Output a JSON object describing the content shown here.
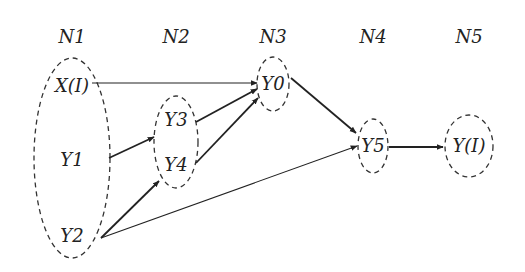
{
  "diagram": {
    "type": "layered-network",
    "layers": [
      {
        "id": "N1",
        "label": "N1",
        "x": 72,
        "ellipse": {
          "cx": 72,
          "cy": 158,
          "rx": 38,
          "ry": 100
        },
        "nodes": [
          {
            "id": "X(I)",
            "label": "X(I)",
            "x": 72,
            "y": 86
          },
          {
            "id": "Y1",
            "label": "Y1",
            "x": 72,
            "y": 160
          },
          {
            "id": "Y2",
            "label": "Y2",
            "x": 72,
            "y": 236
          }
        ]
      },
      {
        "id": "N2",
        "label": "N2",
        "x": 176,
        "ellipse": {
          "cx": 176,
          "cy": 142,
          "rx": 22,
          "ry": 46
        },
        "nodes": [
          {
            "id": "Y3",
            "label": "Y3",
            "x": 176,
            "y": 120
          },
          {
            "id": "Y4",
            "label": "Y4",
            "x": 176,
            "y": 165
          }
        ]
      },
      {
        "id": "N3",
        "label": "N3",
        "x": 273,
        "ellipse": {
          "cx": 273,
          "cy": 84,
          "rx": 16,
          "ry": 27
        },
        "nodes": [
          {
            "id": "Y0",
            "label": "Y0",
            "x": 273,
            "y": 84
          }
        ]
      },
      {
        "id": "N4",
        "label": "N4",
        "x": 373,
        "ellipse": {
          "cx": 373,
          "cy": 146,
          "rx": 15,
          "ry": 27
        },
        "nodes": [
          {
            "id": "Y5",
            "label": "Y5",
            "x": 373,
            "y": 146
          }
        ]
      },
      {
        "id": "N5",
        "label": "N5",
        "x": 469,
        "ellipse": {
          "cx": 469,
          "cy": 146,
          "rx": 24,
          "ry": 31
        },
        "nodes": [
          {
            "id": "Y(I)",
            "label": "Y(I)",
            "x": 469,
            "y": 146
          }
        ]
      }
    ],
    "edges": [
      {
        "from": "X(I)",
        "to": "Y0",
        "x1": 92,
        "y1": 83,
        "x2": 257,
        "y2": 83,
        "width": 1.1
      },
      {
        "from": "Y1",
        "to": "Y3",
        "x1": 109,
        "y1": 158,
        "x2": 154,
        "y2": 137,
        "width": 1.8
      },
      {
        "from": "Y2",
        "to": "Y4",
        "x1": 101,
        "y1": 238,
        "x2": 159,
        "y2": 181,
        "width": 1.8
      },
      {
        "from": "Y2",
        "to": "Y5",
        "x1": 101,
        "y1": 238,
        "x2": 357,
        "y2": 146,
        "width": 1.1
      },
      {
        "from": "Y3",
        "to": "Y0",
        "x1": 196,
        "y1": 122,
        "x2": 257,
        "y2": 89,
        "width": 1.8
      },
      {
        "from": "Y4",
        "to": "Y0",
        "x1": 196,
        "y1": 163,
        "x2": 258,
        "y2": 98,
        "width": 1.8
      },
      {
        "from": "Y0",
        "to": "Y5",
        "x1": 291,
        "y1": 78,
        "x2": 356,
        "y2": 133,
        "width": 1.8
      },
      {
        "from": "Y5",
        "to": "Y(I)",
        "x1": 389,
        "y1": 147,
        "x2": 443,
        "y2": 147,
        "width": 2.0
      }
    ]
  }
}
